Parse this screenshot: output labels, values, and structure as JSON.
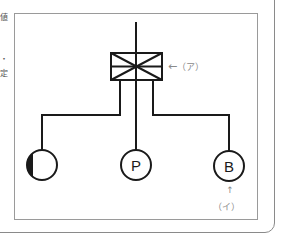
{
  "diagram": {
    "type": "circuit-schematic",
    "edge_fragments": [
      "値",
      "・",
      "定"
    ],
    "switch_box": {
      "label": "（ア）",
      "arrow": "←"
    },
    "nodes": [
      {
        "id": "left",
        "symbol": "half-filled-circle",
        "text": ""
      },
      {
        "id": "center",
        "symbol": "circle",
        "text": "P"
      },
      {
        "id": "right",
        "symbol": "circle",
        "text": "B"
      }
    ],
    "annotation_b": {
      "label": "（イ）",
      "arrow": "↑"
    },
    "colors": {
      "line": "#1a1a1a",
      "label": "#8a8a8a",
      "frame": "#9a9a9a"
    }
  }
}
